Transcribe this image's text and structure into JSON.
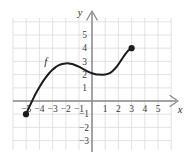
{
  "figure": {
    "background_color": "#ffffff",
    "grid_color": "#dcdcdc",
    "axis_color": "#8a8a8a",
    "curve_color": "#1c1c1c",
    "label_color": "#3a3a3a"
  },
  "axes": {
    "x_label": "x",
    "y_label": "y",
    "x_ticks_negative": [
      "−5",
      "−4",
      "−3",
      "−2",
      "−1"
    ],
    "x_ticks_positive": [
      "1",
      "2",
      "3",
      "4",
      "5"
    ],
    "y_ticks_positive": [
      "5",
      "4",
      "3",
      "2",
      "1"
    ],
    "y_ticks_negative": [
      "−1",
      "−2",
      "−3"
    ]
  },
  "curve": {
    "name": "f"
  },
  "chart_data": {
    "type": "line",
    "title": "",
    "xlabel": "x",
    "ylabel": "y",
    "xlim": [
      -6,
      6.5
    ],
    "ylim": [
      -4,
      6
    ],
    "grid": true,
    "legend": "none",
    "xticks": [
      -5,
      -4,
      -3,
      -2,
      -1,
      1,
      2,
      3,
      4,
      5
    ],
    "yticks": [
      -3,
      -2,
      -1,
      1,
      2,
      3,
      4,
      5
    ],
    "xticklabels": [
      "−5",
      "−4",
      "−3",
      "−2",
      "−1",
      "1",
      "2",
      "3",
      "4",
      "5"
    ],
    "yticklabels": [
      "−3",
      "−2",
      "−1",
      "1",
      "2",
      "3",
      "4",
      "5"
    ],
    "annotations": [
      {
        "text": "f",
        "x": -3.5,
        "y": 2.75,
        "style": "italic"
      }
    ],
    "series": [
      {
        "name": "f",
        "style": "solid",
        "color": "#1c1c1c",
        "endpoints": [
          {
            "x": -5,
            "y": -1,
            "marker": "filled-circle"
          },
          {
            "x": 3,
            "y": 4,
            "marker": "filled-circle"
          }
        ],
        "x": [
          -5.0,
          -4.75,
          -4.5,
          -4.25,
          -4.0,
          -3.75,
          -3.5,
          -3.25,
          -3.0,
          -2.75,
          -2.5,
          -2.25,
          -2.0,
          -1.75,
          -1.5,
          -1.25,
          -1.0,
          -0.75,
          -0.5,
          -0.25,
          0.0,
          0.25,
          0.5,
          0.75,
          1.0,
          1.25,
          1.5,
          1.75,
          2.0,
          2.25,
          2.5,
          2.75,
          3.0
        ],
        "y": [
          -1.0,
          -0.45,
          0.08,
          0.58,
          1.02,
          1.43,
          1.79,
          2.1,
          2.36,
          2.57,
          2.72,
          2.81,
          2.85,
          2.85,
          2.8,
          2.71,
          2.6,
          2.47,
          2.33,
          2.2,
          2.1,
          2.03,
          2.0,
          1.99,
          2.0,
          2.07,
          2.22,
          2.46,
          2.78,
          3.15,
          3.52,
          3.82,
          4.0
        ]
      }
    ]
  }
}
